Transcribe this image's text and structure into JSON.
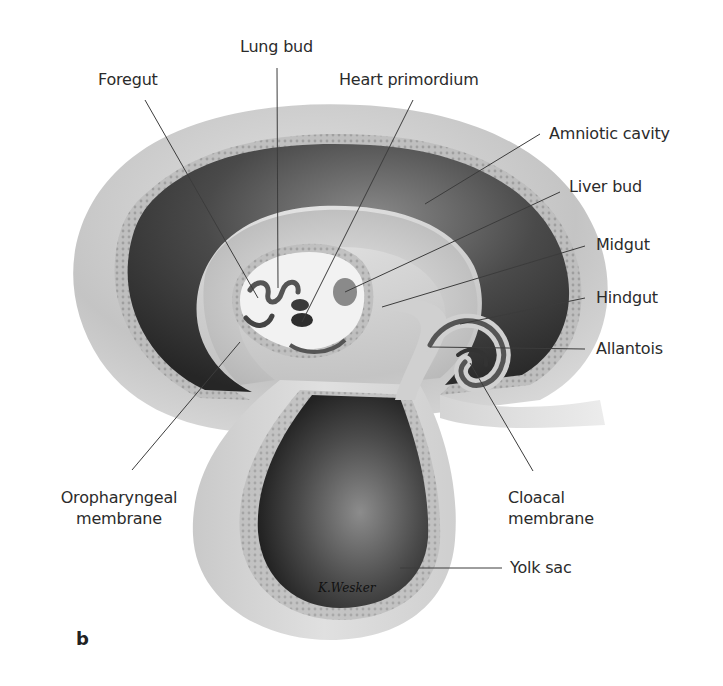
{
  "figure": {
    "panel_letter": "b",
    "signature": "K. Wesker",
    "labels": {
      "foregut": "Foregut",
      "lung_bud": "Lung bud",
      "heart_primordium": "Heart primordium",
      "amniotic_cavity": "Amniotic cavity",
      "liver_bud": "Liver bud",
      "midgut": "Midgut",
      "hindgut": "Hindgut",
      "allantois": "Allantois",
      "oropharyngeal_membrane_line1": "Oropharyngeal",
      "oropharyngeal_membrane_line2": "membrane",
      "cloacal_membrane_line1": "Cloacal",
      "cloacal_membrane_line2": "membrane",
      "yolk_sac": "Yolk sac"
    },
    "colors": {
      "background": "#ffffff",
      "outer_layer": "#c8c8c8",
      "amniotic_dark": "#3a3a3a",
      "embryo_light": "#d9d9d9",
      "gut_light": "#f2f2f2",
      "yolk_dark": "#2e2e2e",
      "leader_line": "#3c3c3c",
      "text": "#2b2b2b"
    }
  }
}
